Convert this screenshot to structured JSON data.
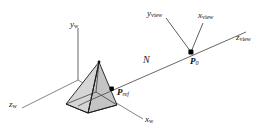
{
  "figure": {
    "caption": "",
    "background_color": "#ffffff",
    "line_color": "#4d4d4d",
    "object_outline_color": "#1a1a1a",
    "object_fill_light": "#d9d9d9",
    "object_fill_dark": "#b3b3b3",
    "point_color": "#000000"
  },
  "world_axes": {
    "y_axis": {
      "label_main": "y",
      "label_sub": "w"
    },
    "z_axis": {
      "label_main": "z",
      "label_sub": "w"
    },
    "x_axis": {
      "label_main": "x",
      "label_sub": "w"
    }
  },
  "view_axes": {
    "y_axis": {
      "label_main": "y",
      "label_sub": "view"
    },
    "x_axis": {
      "label_main": "x",
      "label_sub": "view"
    },
    "z_axis": {
      "label_main": "z",
      "label_sub": "view"
    }
  },
  "points": {
    "origin_view": {
      "label_main": "P",
      "label_sub": "0"
    },
    "reference": {
      "label_main": "P",
      "label_sub": "ref"
    }
  },
  "vectors": {
    "normal": {
      "label": "N"
    }
  },
  "object": {
    "name": "pyramid"
  }
}
